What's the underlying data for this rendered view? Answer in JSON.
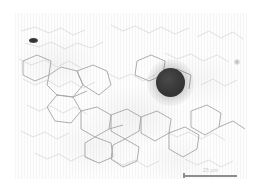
{
  "figure": {
    "kind": "light-micrograph",
    "caption": "",
    "background_color": "#fdfdfd",
    "page_color": "#ffffff"
  },
  "micrograph": {
    "alt_text": "Pale tissue section with faint polygonal cell outlines and one dark round inclusion",
    "field_left_px": 15,
    "field_top_px": 13,
    "field_width_px": 232,
    "field_height_px": 166
  },
  "features": {
    "dark_inclusion": {
      "name": "dark round inclusion",
      "center_x_px": 170,
      "center_y_px": 82,
      "diameter_px": 29,
      "color": "#333333"
    },
    "speck_upper_left": {
      "name": "small dark elliptical artifact",
      "center_x_px": 33,
      "center_y_px": 40,
      "width_px": 9,
      "height_px": 4,
      "color": "#2e2e2e"
    },
    "speck_right": {
      "name": "faint gray speck",
      "center_x_px": 236,
      "center_y_px": 61,
      "diameter_px": 5,
      "color": "#9b9b9b"
    }
  },
  "scalebar": {
    "label": "25 µm",
    "left_px": 184,
    "top_px": 165,
    "width_px": 53,
    "bar_color": "#8d8d8d",
    "label_color": "#c9c9c9"
  }
}
